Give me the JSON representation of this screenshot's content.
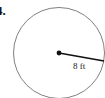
{
  "problem": {
    "number": "4."
  },
  "figure": {
    "shape": "circle",
    "radius_label": "8 ft",
    "colors": {
      "circle_stroke": "#808080",
      "radius_line": "#111111",
      "center_dot": "#111111"
    }
  }
}
